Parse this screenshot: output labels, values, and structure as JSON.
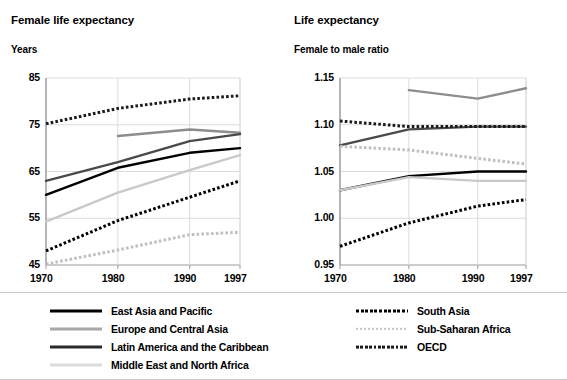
{
  "topstrip": {
    "left_text": "",
    "right_text": ""
  },
  "colors": {
    "east_asia_pacific": "#000000",
    "europe_central_asia": "#8d8d8d",
    "latin_america_caribbean": "#4a4a4a",
    "middle_east_north_africa": "#c9c9c9",
    "south_asia": "#000000",
    "sub_saharan_africa": "#c0c0c0",
    "oecd": "#1a1a1a",
    "grid": "#d8d8dd",
    "axis": "#9a9aa2"
  },
  "left_panel": {
    "title": "Female life expectancy",
    "unit_label": "Years",
    "legend": [
      {
        "name": "East Asia and Pacific",
        "style": "solid",
        "color": "#000000"
      },
      {
        "name": "Europe and Central Asia",
        "style": "solid",
        "color": "#8d8d8d"
      },
      {
        "name": "Latin America and the Caribbean",
        "style": "solid",
        "color": "#4a4a4a"
      },
      {
        "name": "Middle East and North Africa",
        "style": "solid",
        "color": "#c9c9c9"
      }
    ]
  },
  "right_panel": {
    "title": "Life expectancy",
    "unit_label": "Female to male ratio",
    "legend": [
      {
        "name": "South Asia",
        "style": "dotted",
        "color": "#000000"
      },
      {
        "name": "Sub-Saharan Africa",
        "style": "dotted",
        "color": "#c0c0c0"
      },
      {
        "name": "OECD",
        "style": "dotted",
        "color": "#1a1a1a"
      }
    ]
  },
  "chart_data": [
    {
      "id": "female-life-expectancy",
      "type": "line",
      "title": "Female life expectancy",
      "xlabel": "",
      "ylabel": "Years",
      "x": [
        1970,
        1980,
        1990,
        1997
      ],
      "xtick_labels": [
        "1970",
        "1980",
        "1990",
        "1997"
      ],
      "ytick_labels": [
        "45",
        "55",
        "65",
        "75",
        "85"
      ],
      "yticks": [
        45,
        55,
        65,
        75,
        85
      ],
      "ylim": [
        45,
        85
      ],
      "grid": true,
      "legend_position": "below",
      "series": [
        {
          "name": "East Asia and Pacific",
          "style": "solid",
          "color": "#000000",
          "values": [
            60.0,
            65.8,
            69.0,
            70.0
          ]
        },
        {
          "name": "Europe and Central Asia",
          "style": "solid",
          "color": "#8d8d8d",
          "x": [
            1980,
            1990,
            1997
          ],
          "values": [
            72.6,
            74.0,
            73.3
          ]
        },
        {
          "name": "Latin America and the Caribbean",
          "style": "solid",
          "color": "#4a4a4a",
          "values": [
            63.0,
            67.0,
            71.5,
            73.0
          ]
        },
        {
          "name": "Middle East and North Africa",
          "style": "solid",
          "color": "#c9c9c9",
          "values": [
            54.3,
            60.5,
            65.3,
            68.5
          ]
        },
        {
          "name": "South Asia",
          "style": "dotted",
          "color": "#000000",
          "values": [
            48.0,
            54.5,
            59.5,
            63.0
          ]
        },
        {
          "name": "Sub-Saharan Africa",
          "style": "dotted",
          "color": "#c0c0c0",
          "values": [
            45.2,
            48.2,
            51.5,
            52.0
          ]
        },
        {
          "name": "OECD",
          "style": "dotted",
          "color": "#1a1a1a",
          "values": [
            75.2,
            78.5,
            80.5,
            81.2
          ]
        }
      ]
    },
    {
      "id": "life-expectancy-female-to-male-ratio",
      "type": "line",
      "title": "Life expectancy",
      "xlabel": "",
      "ylabel": "Female to male ratio",
      "x": [
        1970,
        1980,
        1990,
        1997
      ],
      "xtick_labels": [
        "1970",
        "1980",
        "1990",
        "1997"
      ],
      "ytick_labels": [
        "0.95",
        "1.00",
        "1.05",
        "1.10",
        "1.15"
      ],
      "yticks": [
        0.95,
        1.0,
        1.05,
        1.1,
        1.15
      ],
      "ylim": [
        0.95,
        1.15
      ],
      "grid": true,
      "legend_position": "below",
      "series": [
        {
          "name": "East Asia and Pacific",
          "style": "solid",
          "color": "#000000",
          "values": [
            1.03,
            1.045,
            1.05,
            1.05
          ]
        },
        {
          "name": "Europe and Central Asia",
          "style": "solid",
          "color": "#8d8d8d",
          "x": [
            1980,
            1990,
            1997
          ],
          "values": [
            1.137,
            1.128,
            1.139
          ]
        },
        {
          "name": "Latin America and the Caribbean",
          "style": "solid",
          "color": "#4a4a4a",
          "values": [
            1.078,
            1.095,
            1.098,
            1.098
          ]
        },
        {
          "name": "Middle East and North Africa",
          "style": "solid",
          "color": "#c9c9c9",
          "values": [
            1.03,
            1.044,
            1.04,
            1.04
          ]
        },
        {
          "name": "South Asia",
          "style": "dotted",
          "color": "#000000",
          "values": [
            0.97,
            0.995,
            1.013,
            1.02
          ]
        },
        {
          "name": "Sub-Saharan Africa",
          "style": "dotted",
          "color": "#c0c0c0",
          "values": [
            1.077,
            1.073,
            1.064,
            1.058
          ]
        },
        {
          "name": "OECD",
          "style": "dotted",
          "color": "#1a1a1a",
          "values": [
            1.104,
            1.098,
            1.098,
            1.098
          ]
        }
      ]
    }
  ]
}
